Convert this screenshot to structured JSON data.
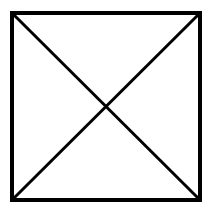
{
  "diagram": {
    "stroke_color": "#000000",
    "background": "#ffffff",
    "square": {
      "x": 12,
      "y": 13,
      "width": 188,
      "height": 187,
      "stroke_width": 4
    },
    "diagonals": [
      {
        "x1": 12,
        "y1": 13,
        "x2": 200,
        "y2": 200,
        "stroke_width": 3
      },
      {
        "x1": 200,
        "y1": 13,
        "x2": 12,
        "y2": 200,
        "stroke_width": 3
      }
    ]
  }
}
